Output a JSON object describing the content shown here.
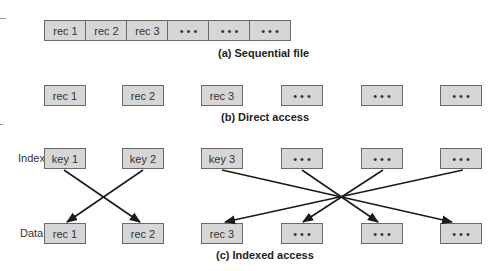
{
  "sequential": {
    "records": [
      "rec 1",
      "rec 2",
      "rec 3",
      "• • •",
      "• • •",
      "• • •"
    ],
    "caption": "(a) Sequential file"
  },
  "direct": {
    "records": [
      "rec 1",
      "rec 2",
      "rec 3",
      "• • •",
      "• • •",
      "• • •"
    ],
    "caption": "(b) Direct access"
  },
  "indexed": {
    "index_label": "Index",
    "data_label": "Data",
    "index": [
      "key 1",
      "key 2",
      "key 3",
      "• • •",
      "• • •",
      "• • •"
    ],
    "data": [
      "rec 1",
      "rec 2",
      "rec 3",
      "• • •",
      "• • •",
      "• • •"
    ],
    "caption": "(c) Indexed access",
    "links": [
      {
        "from": "key 1",
        "to": "rec 2"
      },
      {
        "from": "key 2",
        "to": "rec 1"
      },
      {
        "from": "key 3",
        "to": "data 6"
      },
      {
        "from": "index 4",
        "to": "data 5"
      },
      {
        "from": "index 5",
        "to": "data 4"
      },
      {
        "from": "index 6",
        "to": "rec 3"
      }
    ]
  }
}
